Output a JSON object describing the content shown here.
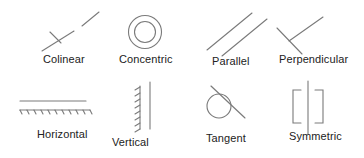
{
  "diagram": {
    "stroke_color": "#7a7a7a",
    "text_color": "#222222",
    "constraints": [
      {
        "name": "colinear",
        "label": "Colinear",
        "icon": "colinear-icon"
      },
      {
        "name": "concentric",
        "label": "Concentric",
        "icon": "concentric-icon"
      },
      {
        "name": "parallel",
        "label": "Parallel",
        "icon": "parallel-icon"
      },
      {
        "name": "perpendicular",
        "label": "Perpendicular",
        "icon": "perpendicular-icon"
      },
      {
        "name": "horizontal",
        "label": "Horizontal",
        "icon": "horizontal-icon"
      },
      {
        "name": "vertical",
        "label": "Vertical",
        "icon": "vertical-icon"
      },
      {
        "name": "tangent",
        "label": "Tangent",
        "icon": "tangent-icon"
      },
      {
        "name": "symmetric",
        "label": "Symmetric",
        "icon": "symmetric-icon"
      }
    ]
  }
}
